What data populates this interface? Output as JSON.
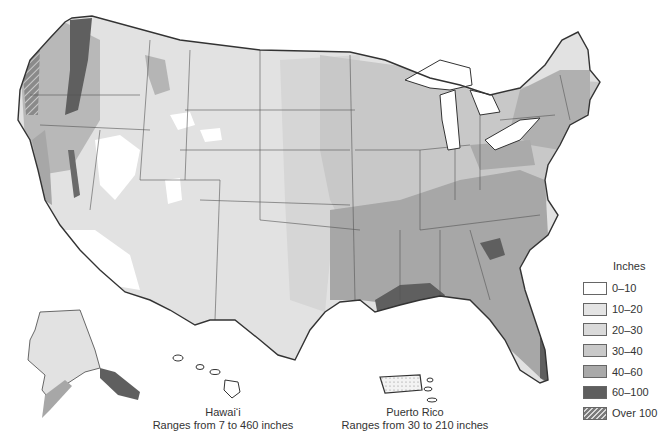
{
  "map": {
    "title": "Average annual precipitation, United States",
    "colors": {
      "c0_10": "#ffffff",
      "c10_20": "#e4e4e4",
      "c20_30": "#dadada",
      "c30_40": "#c9c9c9",
      "c40_60": "#a9a9a9",
      "c60_100": "#5e5e5e",
      "border": "#333333"
    }
  },
  "legend": {
    "title": "Inches",
    "items": [
      {
        "label": "0–10",
        "color": "#ffffff",
        "pattern": "solid"
      },
      {
        "label": "10–20",
        "color": "#e4e4e4",
        "pattern": "solid"
      },
      {
        "label": "20–30",
        "color": "#dadada",
        "pattern": "solid"
      },
      {
        "label": "30–40",
        "color": "#c9c9c9",
        "pattern": "solid"
      },
      {
        "label": "40–60",
        "color": "#a9a9a9",
        "pattern": "solid"
      },
      {
        "label": "60–100",
        "color": "#5e5e5e",
        "pattern": "solid"
      },
      {
        "label": "Over 100",
        "color": "#7a7a7a",
        "pattern": "hatched"
      }
    ]
  },
  "insets": {
    "hawaii": {
      "name": "Hawai‘i",
      "range": "Ranges from 7 to 460 inches"
    },
    "puerto_rico": {
      "name": "Puerto Rico",
      "range": "Ranges from 30 to 210 inches"
    }
  }
}
